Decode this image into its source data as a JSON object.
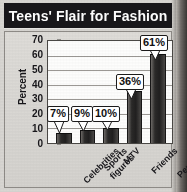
{
  "figure": {
    "title": "Teens' Flair for Fashion"
  },
  "chart_data": {
    "type": "bar",
    "title": "Teens' Flair for Fashion",
    "xlabel": "",
    "ylabel": "Percent",
    "ylim": [
      0,
      70
    ],
    "yticks": [
      0,
      10,
      20,
      30,
      40,
      50,
      60,
      70
    ],
    "ytick_labels": [
      "0",
      "10",
      "20",
      "30",
      "40",
      "50",
      "60",
      "70"
    ],
    "grid": true,
    "legend": false,
    "categories": [
      "Celebrities",
      "Sports figures",
      "MTV",
      "Friends",
      "Personal style"
    ],
    "category_lines": [
      [
        "Celebrities"
      ],
      [
        "Sports",
        "figures"
      ],
      [
        "MTV"
      ],
      [
        "Friends"
      ],
      [
        "Personal",
        "style"
      ]
    ],
    "values": [
      7,
      9,
      10,
      36,
      61
    ],
    "data_labels": [
      "7%",
      "9%",
      "10%",
      "36%",
      "61%"
    ],
    "bar_color": "#242322",
    "plot_background": "#fdfdfc",
    "gridline_color": "#9b9894",
    "title_background": "#18171a",
    "title_color": "#ffffff",
    "figure_background": "#d8d6d2"
  }
}
